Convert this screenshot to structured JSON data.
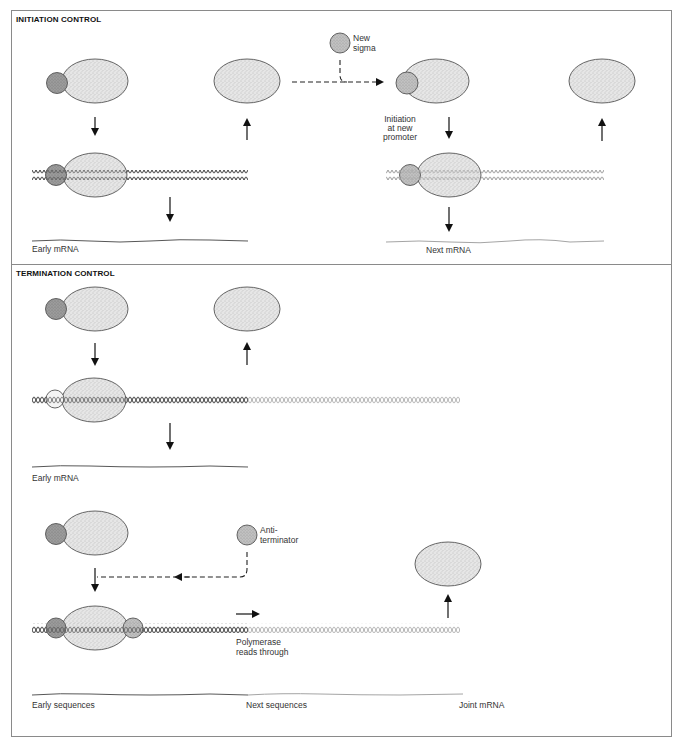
{
  "figure": {
    "panels": [
      {
        "id": "initiation",
        "title": "INITIATION CONTROL",
        "labels": {
          "new_factor": "New sigma",
          "new_factor_line1": "New",
          "new_factor_line2": "sigma",
          "step_line1": "Initiation",
          "step_line2": "at new",
          "step_line3": "promoter",
          "product_left": "Early mRNA",
          "product_right": "Next mRNA"
        }
      },
      {
        "id": "termination",
        "title": "TERMINATION CONTROL",
        "labels": {
          "product_upper": "Early mRNA",
          "new_factor_line1": "Anti-",
          "new_factor_line2": "terminator",
          "readthrough_line1": "Polymerase",
          "readthrough_line2": "reads through",
          "segment_early": "Early sequences",
          "segment_next": "Next sequences",
          "product_joint": "Joint mRNA"
        }
      }
    ],
    "colors": {
      "core_enzyme_fill": "#e4e4e4",
      "sigma_fill": "#9a9a9a",
      "new_factor_fill": "#bdbdbd",
      "dna_early": "#555555",
      "dna_next": "#aaaaaa",
      "frame": "#8a8a8a"
    }
  }
}
